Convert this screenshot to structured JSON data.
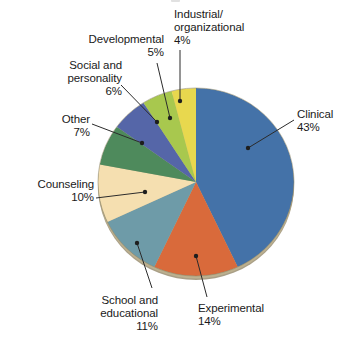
{
  "chart_data": {
    "type": "pie",
    "title": "",
    "xlabel": "",
    "ylabel": "",
    "legend_position": "callout-labels",
    "grid": false,
    "start_angle_deg": 0,
    "direction": "clockwise",
    "units": "percent",
    "total": 100,
    "categories": [
      "Clinical",
      "Experimental",
      "School and educational",
      "Counseling",
      "Other",
      "Social and personality",
      "Developmental",
      "Industrial/organizational"
    ],
    "values": [
      43,
      14,
      11,
      10,
      7,
      6,
      5,
      4
    ],
    "colors": [
      "#4472a8",
      "#d96a3b",
      "#6e9ba8",
      "#f5dfb0",
      "#4e8a5c",
      "#5566a8",
      "#a8c84e",
      "#e8d84e"
    ],
    "slices": [
      {
        "label": "Clinical",
        "value": 43,
        "value_text": "43%",
        "color": "#4472a8"
      },
      {
        "label": "Experimental",
        "value": 14,
        "value_text": "14%",
        "color": "#d96a3b"
      },
      {
        "label": "School and educational",
        "value": 11,
        "value_text": "11%",
        "color": "#6e9ba8"
      },
      {
        "label": "Counseling",
        "value": 10,
        "value_text": "10%",
        "color": "#f5dfb0"
      },
      {
        "label": "Other",
        "value": 7,
        "value_text": "7%",
        "color": "#4e8a5c"
      },
      {
        "label": "Social and personality",
        "value": 6,
        "value_text": "6%",
        "color": "#5566a8"
      },
      {
        "label": "Developmental",
        "value": 5,
        "value_text": "5%",
        "color": "#a8c84e"
      },
      {
        "label": "Industrial/organizational",
        "value": 4,
        "value_text": "4%",
        "color": "#e8d84e"
      }
    ]
  },
  "labels": {
    "clinical": "Clinical\n43%",
    "experimental": "Experimental\n14%",
    "school": "School and\neducational\n11%",
    "counseling": "Counseling\n10%",
    "other": "Other\n7%",
    "social": "Social and\npersonality\n6%",
    "developmental": "Developmental\n5%",
    "industrial": "Industrial/\norganizational\n4%"
  },
  "style": {
    "background": "#ffffff",
    "text_color": "#1a1a1a",
    "leader_line_color": "#2b2b2b",
    "rim_color": "#9a8e72"
  }
}
